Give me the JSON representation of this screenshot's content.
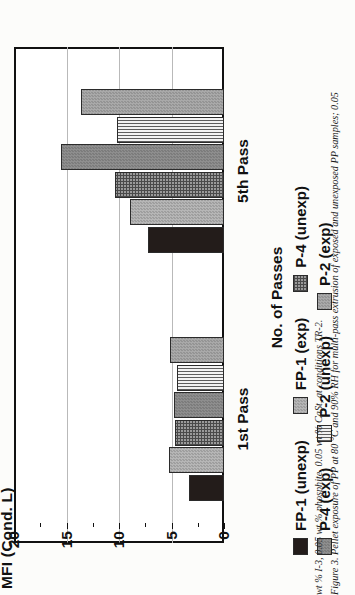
{
  "chart_data": {
    "type": "bar",
    "orientation": "vertical",
    "title": "",
    "xlabel": "No. of Passes",
    "ylabel": "MFI (Cond. L)",
    "categories": [
      "1st Pass",
      "5th Pass"
    ],
    "yticks": [
      0,
      5,
      10,
      15,
      20
    ],
    "ylim": [
      0,
      20
    ],
    "grid": true,
    "legend_position": "below",
    "series": [
      {
        "name": "FP-1 (unexp)",
        "fill": "solid-black",
        "color": "#231c1a",
        "values": [
          3.3,
          7.2
        ]
      },
      {
        "name": "FP-1 (exp)",
        "fill": "light-gray-dots",
        "color": "#aaaaaa",
        "values": [
          5.2,
          9.0
        ]
      },
      {
        "name": "P-4 (unexp)",
        "fill": "dark-crosshatch",
        "color": "#6a6a6a",
        "values": [
          4.7,
          10.4
        ]
      },
      {
        "name": "P-4 (exp)",
        "fill": "mid-gray-dots",
        "color": "#848484",
        "values": [
          4.8,
          15.5
        ]
      },
      {
        "name": "P-2 (unexp)",
        "fill": "vertical-stripes",
        "color": "#5d5d5d",
        "values": [
          4.5,
          10.2
        ]
      },
      {
        "name": "P-2 (exp)",
        "fill": "gray-dots",
        "color": "#9f9f9f",
        "values": [
          5.1,
          13.6
        ]
      }
    ]
  },
  "axis": {
    "y_title": "MFI (Cond. L)",
    "x_title": "No. of Passes",
    "tick_labels": [
      "0",
      "5",
      "10",
      "15",
      "20"
    ],
    "category_labels": [
      "1st Pass",
      "5th Pass"
    ]
  },
  "legend": {
    "row1": [
      {
        "label": "FP-1 (unexp)",
        "swatch": "solid-black"
      },
      {
        "label": "FP-1 (exp)",
        "swatch": "light-gray-dots"
      },
      {
        "label": "P-4 (unexp)",
        "swatch": "dark-crosshatch"
      }
    ],
    "row2": [
      {
        "label": "P-4 (exp)",
        "swatch": "mid-gray-dots"
      },
      {
        "label": "P-2 (unexp)",
        "swatch": "vertical-stripes"
      },
      {
        "label": "P-2 (exp)",
        "swatch": "gray-dots"
      }
    ]
  },
  "caption": {
    "line1": "Figure 3.  Pellet exposure of PP at 80 °C and 90% RH for multi-pass extrusion of exposed and unexposed PP samples; 0.05",
    "line2": "wt % I-3, 0.05 wt % phosphite, 0.05 wt % CaSt, at conditions TR-2."
  }
}
